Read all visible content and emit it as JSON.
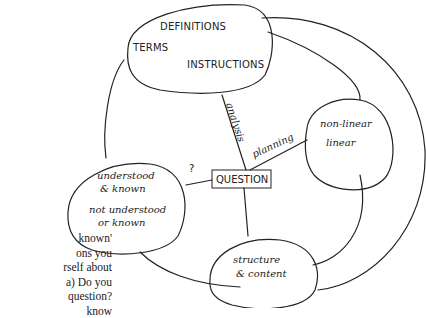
{
  "diagram": {
    "nodes": {
      "top": {
        "lines": [
          "DEFINITIONS",
          "TERMS",
          "INSTRUCTIONS"
        ]
      },
      "right": {
        "lines": [
          "non-linear",
          "linear"
        ]
      },
      "left": {
        "lines": [
          "understood",
          "& known",
          "not understood",
          "or known"
        ]
      },
      "bottom": {
        "lines": [
          "structure",
          "& content"
        ]
      },
      "center": {
        "label": "QUESTION"
      }
    },
    "edges": {
      "top_center": "analysis",
      "right_center": "planning",
      "left_center": "?",
      "bottom_center": ""
    }
  },
  "side_text": {
    "lines": [
      "known'",
      "ons you",
      "rself about",
      "a) Do you",
      "question?",
      "know"
    ]
  }
}
